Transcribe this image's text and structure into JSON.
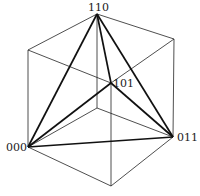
{
  "diagram": {
    "type": "cube-with-inscribed-tetrahedron",
    "vertices": {
      "top": {
        "x": 97,
        "y": 14,
        "label": "110"
      },
      "upper_left": {
        "x": 28,
        "y": 50,
        "label": ""
      },
      "upper_right": {
        "x": 174,
        "y": 39,
        "label": ""
      },
      "left": {
        "x": 28,
        "y": 147,
        "label": "000"
      },
      "right": {
        "x": 173,
        "y": 137,
        "label": "011"
      },
      "bottom": {
        "x": 111,
        "y": 186,
        "label": ""
      },
      "front_center": {
        "x": 111,
        "y": 83,
        "label": "101"
      },
      "back_center": {
        "x": 97,
        "y": 108,
        "label": ""
      }
    },
    "labels": {
      "top": "110",
      "left": "000",
      "right": "011",
      "center": "101"
    },
    "cube_edges": [
      [
        "top",
        "upper_left"
      ],
      [
        "top",
        "upper_right"
      ],
      [
        "upper_left",
        "left"
      ],
      [
        "upper_right",
        "right"
      ],
      [
        "left",
        "bottom"
      ],
      [
        "right",
        "bottom"
      ],
      [
        "upper_left",
        "front_center"
      ],
      [
        "upper_right",
        "front_center"
      ],
      [
        "front_center",
        "bottom"
      ],
      [
        "top",
        "back_center"
      ],
      [
        "left",
        "back_center"
      ],
      [
        "right",
        "back_center"
      ]
    ],
    "tetrahedron_edges": [
      [
        "top",
        "left"
      ],
      [
        "top",
        "right"
      ],
      [
        "top",
        "front_center"
      ],
      [
        "left",
        "right"
      ],
      [
        "left",
        "front_center"
      ],
      [
        "right",
        "front_center"
      ]
    ],
    "colors": {
      "line": "#111111",
      "background": "#ffffff"
    }
  }
}
